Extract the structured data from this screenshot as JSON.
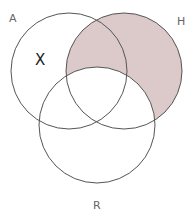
{
  "diagram": {
    "type": "venn",
    "sets": [
      {
        "name": "A",
        "label": "A"
      },
      {
        "name": "H",
        "label": "H"
      },
      {
        "name": "R",
        "label": "R"
      }
    ],
    "shaded_region": "H minus R",
    "marker": {
      "label": "X",
      "region": "A only"
    },
    "colors": {
      "stroke": "#555555",
      "shade": "#dccaca",
      "background": "#ffffff"
    }
  }
}
